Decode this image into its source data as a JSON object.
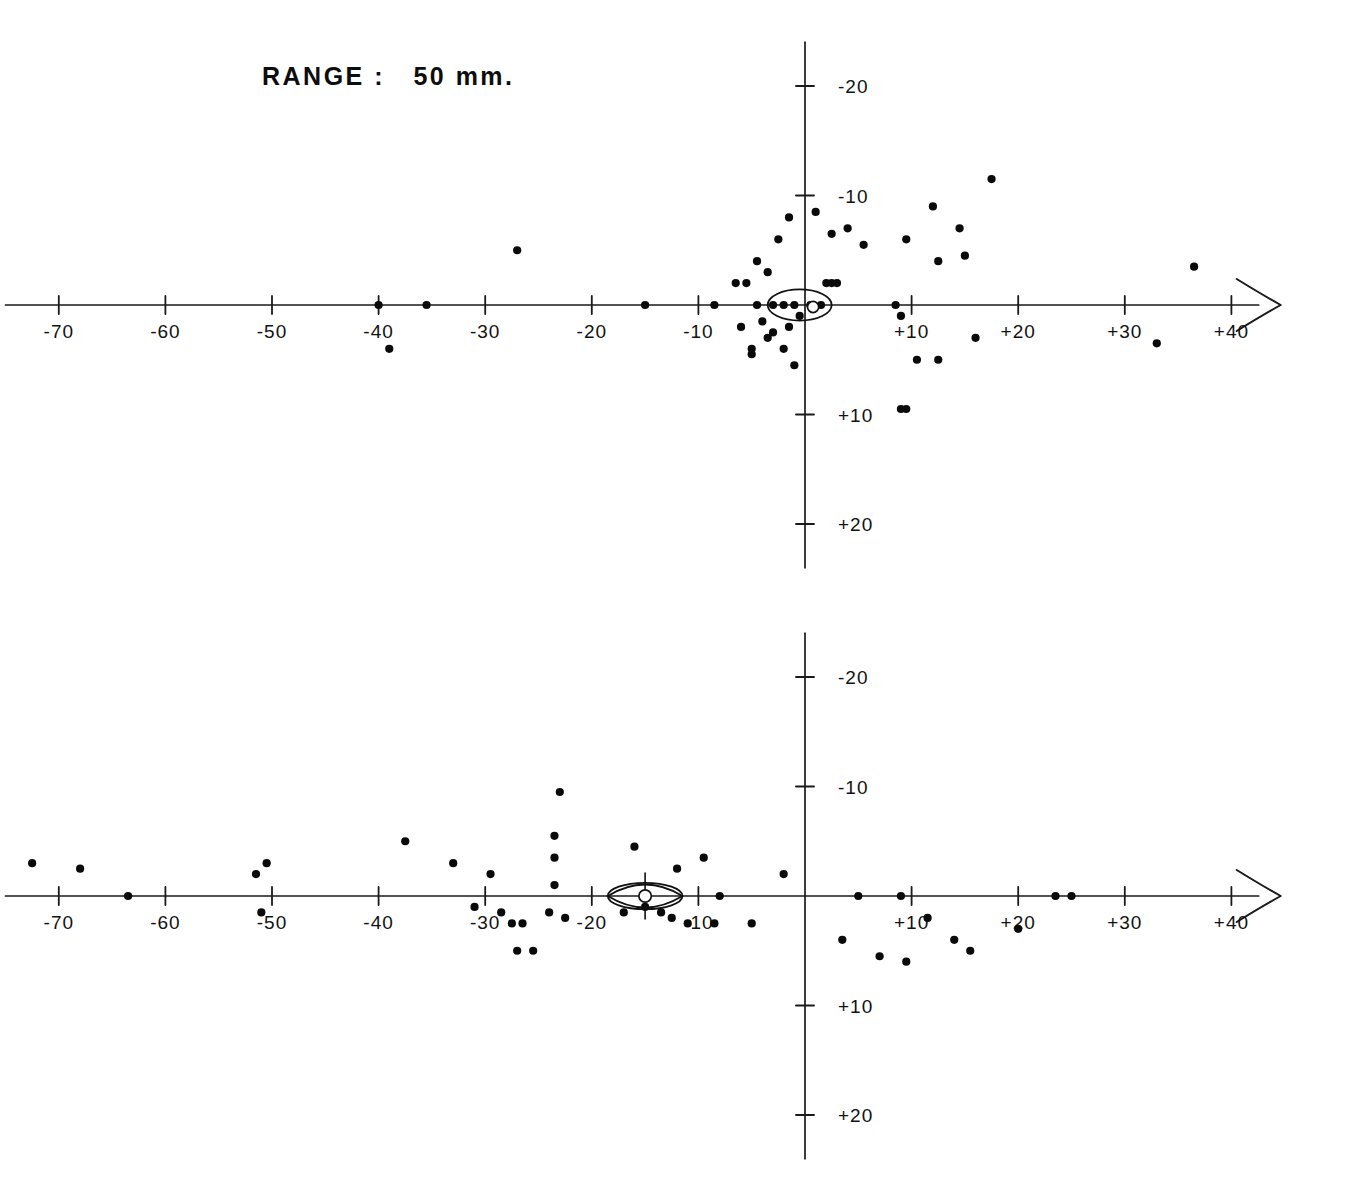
{
  "figure": {
    "background_color": "#ffffff",
    "ink_color": "#111111",
    "panel_count": 2
  },
  "chart_data": [
    {
      "type": "scatter",
      "title": "RANGE :   50 mm.",
      "range_value": "50 mm.",
      "xlabel": "",
      "ylabel": "",
      "xlim": [
        -75,
        45
      ],
      "ylim": [
        24,
        -24
      ],
      "y_axis_inverted": true,
      "grid": false,
      "legend": null,
      "xticks": [
        -70,
        -60,
        -50,
        -40,
        -30,
        -20,
        -10,
        10,
        20,
        30,
        40
      ],
      "xtick_labels": [
        "-70",
        "-60",
        "-50",
        "-40",
        "-30",
        "-20",
        "-10",
        "+10",
        "+20",
        "+30",
        "+40"
      ],
      "yticks": [
        -20,
        -10,
        10,
        20
      ],
      "ytick_labels": [
        "-20",
        "-10",
        "+10",
        "+20"
      ],
      "x_axis_arrow": "right",
      "points": [
        [
          -40.0,
          0.0
        ],
        [
          -39.0,
          4.0
        ],
        [
          -35.5,
          0.0
        ],
        [
          -27.0,
          -5.0
        ],
        [
          -15.0,
          0.0
        ],
        [
          -8.5,
          0.0
        ],
        [
          -6.5,
          -2.0
        ],
        [
          -6.0,
          2.0
        ],
        [
          -5.5,
          -2.0
        ],
        [
          -5.0,
          4.0
        ],
        [
          -5.0,
          4.5
        ],
        [
          -4.5,
          -4.0
        ],
        [
          -4.5,
          0.0
        ],
        [
          -4.0,
          1.5
        ],
        [
          -3.5,
          3.0
        ],
        [
          -3.5,
          -3.0
        ],
        [
          -3.0,
          0.0
        ],
        [
          -3.0,
          2.5
        ],
        [
          -2.5,
          -6.0
        ],
        [
          -2.0,
          4.0
        ],
        [
          -2.0,
          0.0
        ],
        [
          -1.5,
          -8.0
        ],
        [
          -1.5,
          2.0
        ],
        [
          -1.0,
          0.0
        ],
        [
          -1.0,
          5.5
        ],
        [
          -0.5,
          1.0
        ],
        [
          0.5,
          0.0
        ],
        [
          1.0,
          -8.5
        ],
        [
          1.5,
          0.0
        ],
        [
          2.0,
          -2.0
        ],
        [
          2.5,
          -2.0
        ],
        [
          2.5,
          -6.5
        ],
        [
          3.0,
          -2.0
        ],
        [
          4.0,
          -7.0
        ],
        [
          5.5,
          -5.5
        ],
        [
          8.5,
          0.0
        ],
        [
          9.0,
          1.0
        ],
        [
          9.0,
          9.5
        ],
        [
          9.5,
          9.5
        ],
        [
          9.5,
          -6.0
        ],
        [
          10.5,
          5.0
        ],
        [
          12.5,
          -4.0
        ],
        [
          12.0,
          -9.0
        ],
        [
          12.5,
          5.0
        ],
        [
          14.5,
          -7.0
        ],
        [
          15.0,
          -4.5
        ],
        [
          16.0,
          3.0
        ],
        [
          17.5,
          -11.5
        ],
        [
          33.0,
          3.5
        ],
        [
          36.5,
          -3.5
        ]
      ],
      "annotation_ellipse": {
        "shape": "ellipse",
        "center_x": -0.5,
        "center_y": 0.0,
        "semi_axis_x": 3.0,
        "semi_axis_y": 0.75,
        "center_marker": "small-circle"
      }
    },
    {
      "type": "scatter",
      "title": "RANGE :  100 mm.",
      "range_value": "100 mm.",
      "xlabel": "",
      "ylabel": "",
      "xlim": [
        -75,
        45
      ],
      "ylim": [
        24,
        -24
      ],
      "y_axis_inverted": true,
      "grid": false,
      "legend": null,
      "xticks": [
        -70,
        -60,
        -50,
        -40,
        -30,
        -20,
        -10,
        10,
        20,
        30,
        40
      ],
      "xtick_labels": [
        "-70",
        "-60",
        "-50",
        "-40",
        "-30",
        "-20",
        "-10",
        "+10",
        "+20",
        "+30",
        "+40"
      ],
      "yticks": [
        -20,
        -10,
        10,
        20
      ],
      "ytick_labels": [
        "-20",
        "-10",
        "+10",
        "+20"
      ],
      "x_axis_arrow": "right",
      "points": [
        [
          -72.5,
          -3.0
        ],
        [
          -68.0,
          -2.5
        ],
        [
          -63.5,
          0.0
        ],
        [
          -51.5,
          -2.0
        ],
        [
          -50.5,
          -3.0
        ],
        [
          -51.0,
          1.5
        ],
        [
          -37.5,
          -5.0
        ],
        [
          -33.0,
          -3.0
        ],
        [
          -31.0,
          1.0
        ],
        [
          -29.5,
          -2.0
        ],
        [
          -28.5,
          1.5
        ],
        [
          -27.5,
          2.5
        ],
        [
          -26.5,
          2.5
        ],
        [
          -27.0,
          5.0
        ],
        [
          -25.5,
          5.0
        ],
        [
          -24.0,
          1.5
        ],
        [
          -23.0,
          -9.5
        ],
        [
          -23.5,
          -5.5
        ],
        [
          -23.5,
          -3.5
        ],
        [
          -23.5,
          -1.0
        ],
        [
          -22.5,
          2.0
        ],
        [
          -17.0,
          1.5
        ],
        [
          -16.0,
          -4.5
        ],
        [
          -15.0,
          1.0
        ],
        [
          -13.5,
          1.5
        ],
        [
          -12.0,
          -2.5
        ],
        [
          -12.5,
          2.0
        ],
        [
          -11.0,
          2.5
        ],
        [
          -9.5,
          -3.5
        ],
        [
          -8.0,
          0.0
        ],
        [
          -8.5,
          2.5
        ],
        [
          -5.0,
          2.5
        ],
        [
          -2.0,
          -2.0
        ],
        [
          5.0,
          0.0
        ],
        [
          3.5,
          4.0
        ],
        [
          7.0,
          5.5
        ],
        [
          9.0,
          0.0
        ],
        [
          9.5,
          6.0
        ],
        [
          11.5,
          2.0
        ],
        [
          14.0,
          4.0
        ],
        [
          15.5,
          5.0
        ],
        [
          20.0,
          3.0
        ],
        [
          23.5,
          0.0
        ],
        [
          25.0,
          0.0
        ]
      ],
      "annotation_ellipse": {
        "shape": "lens",
        "center_x": -15.0,
        "center_y": 0.0,
        "semi_axis_x": 3.5,
        "semi_axis_y": 1.2,
        "center_marker": "diamond-circle"
      }
    }
  ]
}
